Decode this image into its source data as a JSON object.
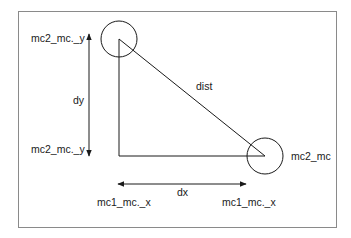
{
  "diagram": {
    "title": "",
    "colors": {
      "stroke": "#1a1a1a",
      "frame": "#8a8a8a",
      "background": "#ffffff"
    },
    "nodes": [
      {
        "id": "mc2",
        "shape": "circle",
        "cx": 119,
        "cy": 39,
        "r": 18
      },
      {
        "id": "mc2_mc",
        "shape": "circle",
        "cx": 265,
        "cy": 156,
        "r": 18,
        "label": "mc2_mc"
      }
    ],
    "edges": [
      {
        "id": "dist",
        "from": "mc2",
        "to": "mc2_mc",
        "label": "dist"
      },
      {
        "id": "vertical-leg",
        "from": [
          119,
          39
        ],
        "to": [
          119,
          156
        ]
      },
      {
        "id": "horizontal-leg",
        "from": [
          119,
          156
        ],
        "to": [
          265,
          156
        ]
      }
    ],
    "labels": {
      "top_y": "mc2_mc._y",
      "bottom_y": "mc2_mc._y",
      "dy": "dy",
      "dist": "dist",
      "mc2_mc": "mc2_mc",
      "dx": "dx",
      "left_x": "mc1_mc._x",
      "right_x": "mc1_mc._x"
    },
    "arrows": {
      "dy": {
        "x": 89,
        "y1": 34,
        "y2": 156,
        "double_headed": true
      },
      "dx": {
        "y": 184,
        "x1": 118,
        "x2": 246,
        "double_headed": true
      }
    }
  }
}
